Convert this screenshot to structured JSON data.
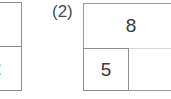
{
  "page": {
    "background_color": "#ffffff",
    "line_color": "#8c8c8c",
    "faint_line_color": "#d8d8d8",
    "text_color": "#3a3a3a"
  },
  "left_figure": {
    "name": "clipped-rectangle-diagram",
    "upper_cell_label": "",
    "lower_cell_label": "2"
  },
  "problem": {
    "number_label": "(2)"
  },
  "right_figure": {
    "name": "partitioned-rectangle-diagram",
    "top_region_label": "8",
    "inner_region_label": "5",
    "empty_region_label": ""
  }
}
